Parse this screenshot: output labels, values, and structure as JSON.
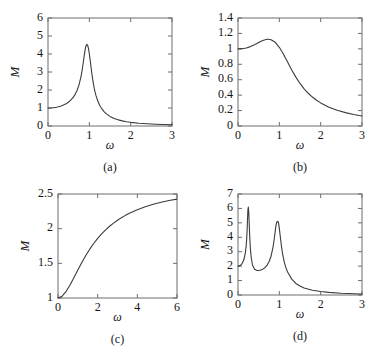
{
  "figure": {
    "title": "",
    "background": "#ffffff",
    "curve_color": "#3b3b3b",
    "axis_color": "#6d6d6d"
  },
  "chart_data": [
    {
      "id": "a",
      "type": "line",
      "title": "",
      "caption": "(a)",
      "xlabel": "ω",
      "ylabel": "M",
      "xlim": [
        0,
        3
      ],
      "ylim": [
        0,
        6
      ],
      "xticks": [
        0,
        1,
        2,
        3
      ],
      "xticklabels": [
        "0",
        "1",
        "2",
        "3"
      ],
      "yticks": [
        0,
        1,
        2,
        3,
        4,
        5,
        6
      ],
      "yticklabels": [
        "0",
        "1",
        "2",
        "3",
        "4",
        "5",
        "6"
      ],
      "grid": false,
      "legend": "none",
      "description": "Magnification factor of a lightly damped single-degree-of-freedom system; sharp resonance peak M=5.0 at omega=1.",
      "x": [
        0,
        0.05,
        0.1,
        0.15,
        0.2,
        0.25,
        0.3,
        0.35,
        0.4,
        0.45,
        0.5,
        0.55,
        0.6,
        0.65,
        0.7,
        0.75,
        0.8,
        0.82,
        0.84,
        0.86,
        0.88,
        0.9,
        0.92,
        0.94,
        0.96,
        0.98,
        1.0,
        1.02,
        1.04,
        1.06,
        1.08,
        1.1,
        1.12,
        1.14,
        1.16,
        1.2,
        1.25,
        1.3,
        1.35,
        1.4,
        1.5,
        1.6,
        1.7,
        1.8,
        1.9,
        2.0,
        2.2,
        2.4,
        2.6,
        2.8,
        3.0
      ],
      "y": [
        1.0,
        1.0025,
        1.0101,
        1.0228,
        1.0417,
        1.0667,
        1.0989,
        1.1396,
        1.1905,
        1.2539,
        1.3333,
        1.4337,
        1.5625,
        1.7316,
        1.9608,
        2.2857,
        2.7624,
        3.0238,
        3.3181,
        3.6384,
        3.9639,
        4.2553,
        4.4604,
        4.5367,
        4.4721,
        4.2994,
        4.0,
        3.6694,
        3.2906,
        2.9283,
        2.6025,
        2.3222,
        2.0821,
        1.876,
        1.699,
        1.413,
        1.1556,
        0.9628,
        0.8149,
        0.6994,
        0.5333,
        0.4213,
        0.3418,
        0.2832,
        0.2389,
        0.2041,
        0.1543,
        0.1215,
        0.0988,
        0.0823,
        0.0698
      ]
    },
    {
      "id": "b",
      "type": "line",
      "title": "",
      "caption": "(b)",
      "xlabel": "ω",
      "ylabel": "M",
      "xlim": [
        0,
        3
      ],
      "ylim": [
        0,
        1.4
      ],
      "xticks": [
        0,
        1,
        2,
        3
      ],
      "xticklabels": [
        "0",
        "1",
        "2",
        "3"
      ],
      "yticks": [
        0,
        0.2,
        0.4,
        0.6,
        0.8,
        1.0,
        1.2,
        1.4
      ],
      "yticklabels": [
        "0",
        "0.2",
        "0.4",
        "0.6",
        "0.8",
        "1",
        "1.2",
        "1.4"
      ],
      "grid": false,
      "legend": "none",
      "description": "Heavily damped system; broad low peak M=1.15 near omega=0.72, decaying to about 0.13 at omega=3.",
      "x": [
        0,
        0.1,
        0.2,
        0.3,
        0.4,
        0.5,
        0.6,
        0.7,
        0.72,
        0.8,
        0.9,
        1.0,
        1.1,
        1.2,
        1.3,
        1.4,
        1.5,
        1.6,
        1.7,
        1.8,
        1.9,
        2.0,
        2.2,
        2.4,
        2.6,
        2.8,
        3.0
      ],
      "y": [
        1.0,
        1.0024,
        1.0118,
        1.029,
        1.0534,
        1.0822,
        1.1092,
        1.125,
        1.1256,
        1.1188,
        1.085,
        1.0204,
        0.931,
        0.8291,
        0.7272,
        0.6334,
        0.5516,
        0.4823,
        0.4241,
        0.3752,
        0.3341,
        0.2994,
        0.2444,
        0.2039,
        0.1733,
        0.1495,
        0.1307
      ]
    },
    {
      "id": "c",
      "type": "line",
      "title": "",
      "caption": "(c)",
      "xlabel": "ω",
      "ylabel": "M",
      "xlim": [
        0,
        6
      ],
      "ylim": [
        1,
        2.5
      ],
      "xticks": [
        0,
        2,
        4,
        6
      ],
      "xticklabels": [
        "0",
        "2",
        "4",
        "6"
      ],
      "yticks": [
        1,
        1.5,
        2,
        2.5
      ],
      "yticklabels": [
        "1",
        "1.5",
        "2",
        "2.5"
      ],
      "grid": false,
      "legend": "none",
      "description": "Monotonically increasing saturating response rising from M=1 at omega=0 to about M=2.42 at omega=6.",
      "x": [
        0,
        0.2,
        0.4,
        0.6,
        0.8,
        1.0,
        1.2,
        1.4,
        1.6,
        1.8,
        2.0,
        2.2,
        2.4,
        2.6,
        2.8,
        3.0,
        3.2,
        3.4,
        3.6,
        3.8,
        4.0,
        4.4,
        4.8,
        5.2,
        5.6,
        6.0
      ],
      "y": [
        1.0,
        1.0243,
        1.0905,
        1.1847,
        1.293,
        1.4046,
        1.5125,
        1.6128,
        1.7042,
        1.7863,
        1.8596,
        1.9249,
        1.9829,
        2.0345,
        2.0806,
        2.1218,
        2.1587,
        2.1919,
        2.2218,
        2.2489,
        2.2734,
        2.3157,
        2.3508,
        2.3802,
        2.4052,
        2.4265
      ]
    },
    {
      "id": "d",
      "type": "line",
      "title": "",
      "caption": "(d)",
      "xlabel": "ω",
      "ylabel": "M",
      "xlim": [
        0,
        3
      ],
      "ylim": [
        0,
        7
      ],
      "xticks": [
        0,
        1,
        2,
        3
      ],
      "xticklabels": [
        "0",
        "1",
        "2",
        "3"
      ],
      "yticks": [
        0,
        1,
        2,
        3,
        4,
        5,
        6,
        7
      ],
      "yticklabels": [
        "0",
        "1",
        "2",
        "3",
        "4",
        "5",
        "6",
        "7"
      ],
      "grid": false,
      "legend": "none",
      "description": "Two-degree-of-freedom response starting at M=2; sharp first resonance M=6.1 at omega=0.25 and second resonance M=5.1 at omega=0.97.",
      "x": [
        0,
        0.05,
        0.1,
        0.14,
        0.18,
        0.2,
        0.21,
        0.22,
        0.23,
        0.24,
        0.25,
        0.26,
        0.27,
        0.28,
        0.29,
        0.3,
        0.32,
        0.35,
        0.4,
        0.45,
        0.5,
        0.55,
        0.6,
        0.65,
        0.7,
        0.75,
        0.8,
        0.85,
        0.88,
        0.9,
        0.92,
        0.94,
        0.96,
        0.97,
        0.98,
        1.0,
        1.02,
        1.05,
        1.08,
        1.12,
        1.16,
        1.2,
        1.3,
        1.4,
        1.5,
        1.6,
        1.8,
        2.0,
        2.2,
        2.5,
        2.8,
        3.0
      ],
      "y": [
        2.0,
        2.04,
        2.18,
        2.42,
        2.95,
        3.48,
        3.88,
        4.45,
        5.22,
        5.92,
        6.1,
        5.72,
        5.02,
        4.3,
        3.69,
        3.2,
        2.58,
        2.08,
        1.79,
        1.71,
        1.7,
        1.73,
        1.79,
        1.89,
        2.05,
        2.3,
        2.69,
        3.36,
        3.95,
        4.43,
        4.84,
        5.06,
        5.1,
        5.08,
        5.0,
        4.62,
        4.12,
        3.41,
        2.84,
        2.28,
        1.88,
        1.59,
        1.1,
        0.8,
        0.62,
        0.49,
        0.33,
        0.24,
        0.18,
        0.12,
        0.09,
        0.07
      ]
    }
  ]
}
